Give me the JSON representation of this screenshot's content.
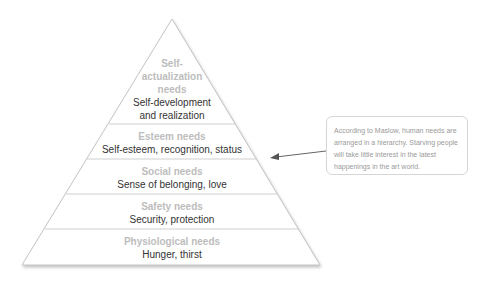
{
  "pyramid": {
    "levels": [
      {
        "heading": "Self-actualization needs",
        "heading_lines": [
          "Self-",
          "actualization",
          "needs"
        ],
        "detail_lines": [
          "Self-development",
          "and realization"
        ]
      },
      {
        "heading": "Esteem needs",
        "detail": "Self-esteem, recognition, status"
      },
      {
        "heading": "Social needs",
        "detail": "Sense of belonging, love"
      },
      {
        "heading": "Safety needs",
        "detail": "Security, protection"
      },
      {
        "heading": "Physiological needs",
        "detail": "Hunger, thirst"
      }
    ]
  },
  "callout": {
    "text": "According to Maslow, human needs are arranged in a hierarchy. Starving people will take little interest in the latest happenings in the art world."
  },
  "colors": {
    "heading": "#bdbdbd",
    "detail": "#333333",
    "outline": "#bfbfbf"
  }
}
